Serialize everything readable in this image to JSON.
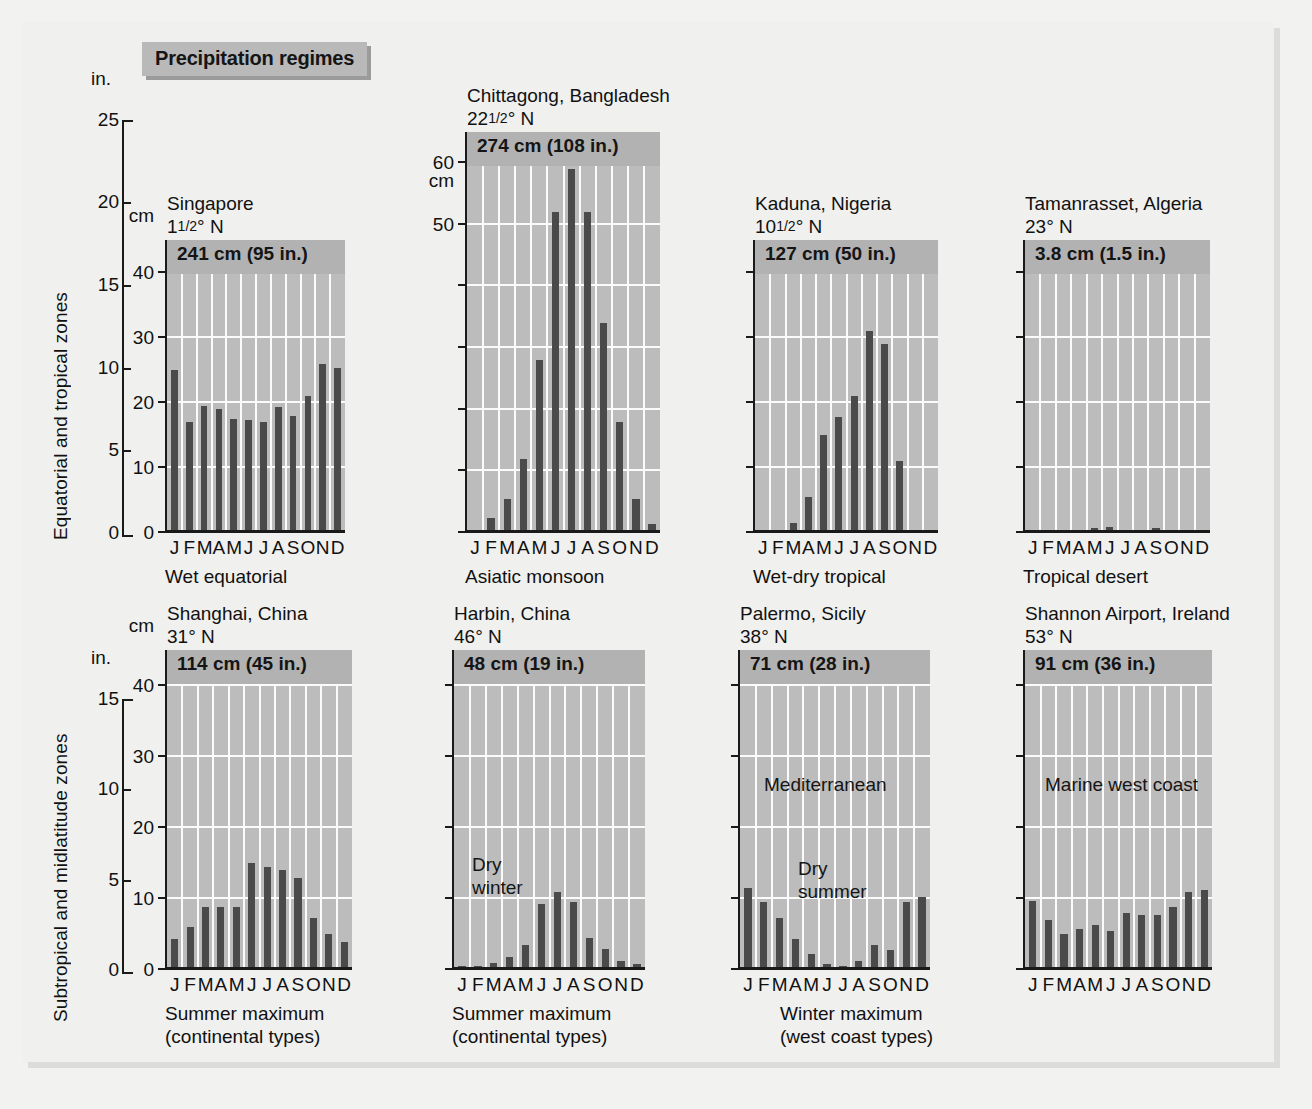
{
  "figure": {
    "title": "Precipitation regimes",
    "row_labels": {
      "top": "Equatorial and tropical zones",
      "bottom": "Subtropical and midlatitude zones"
    },
    "axis_units": {
      "inches": "in.",
      "cm": "cm"
    },
    "inch_ticks_top": [
      "25",
      "20",
      "15",
      "10",
      "5",
      "0"
    ],
    "inch_ticks_bottom": [
      "15",
      "10",
      "5",
      "0"
    ],
    "months_label": "J FMAMJ JASOND",
    "month_letters": [
      "J",
      "F",
      "M",
      "A",
      "M",
      "J",
      "J",
      "A",
      "S",
      "O",
      "N",
      "D"
    ],
    "colors": {
      "page_background": "#f2f2f0",
      "panel_plot": "#bcbcbc",
      "total_band": "#b2b2b2",
      "bar": "#4a4a4a",
      "grid": "#fbfbfb",
      "axis": "#1a1a1a",
      "badge": "#b9b9b9",
      "badge_shadow": "#9b9b9b"
    },
    "captions": [
      {
        "line1": "Summer maximum",
        "line2": "(continental types)"
      },
      {
        "line1": "Summer maximum",
        "line2": "(continental types)"
      },
      {
        "line1": "Winter maximum",
        "line2": "(west coast types)"
      }
    ]
  },
  "chart_data": {
    "type": "bar",
    "title": "Precipitation regimes",
    "xlabel": "",
    "ylabel": "Precipitation",
    "grid": true,
    "legend": "none",
    "panels": [
      {
        "id": "singapore",
        "station": "Singapore",
        "latitude": "1¹⁄₂° N",
        "annual_total": "241 cm (95 in.)",
        "annual_cm": 241,
        "annual_in": 95,
        "regime": "Wet equatorial",
        "cm_ticks": [
          0,
          10,
          20,
          30,
          40
        ],
        "cm_tick_labels": [
          "0",
          "10",
          "20",
          "30",
          "40"
        ],
        "ylim_cm": [
          0,
          45
        ],
        "categories": [
          "J",
          "F",
          "M",
          "A",
          "M",
          "J",
          "J",
          "A",
          "S",
          "O",
          "N",
          "D"
        ],
        "values_cm": [
          25.0,
          17.0,
          19.5,
          19.0,
          17.5,
          17.3,
          17.0,
          19.3,
          18.0,
          21.0,
          26.0,
          25.3
        ],
        "note": "",
        "row": "top"
      },
      {
        "id": "chittagong",
        "station": "Chittagong, Bangladesh",
        "latitude": "22¹⁄₂° N",
        "annual_total": "274 cm (108 in.)",
        "annual_cm": 274,
        "annual_in": 108,
        "regime": "Asiatic monsoon",
        "cm_ticks": [
          0,
          10,
          20,
          30,
          40,
          50,
          60
        ],
        "cm_tick_labels": [
          "",
          "",
          "",
          "",
          "",
          "50",
          "60"
        ],
        "ylim_cm": [
          0,
          65
        ],
        "categories": [
          "J",
          "F",
          "M",
          "A",
          "M",
          "J",
          "J",
          "A",
          "S",
          "O",
          "N",
          "D"
        ],
        "values_cm": [
          0.5,
          2.5,
          5.5,
          12.0,
          28.0,
          52.0,
          59.0,
          52.0,
          34.0,
          18.0,
          5.5,
          1.5
        ],
        "note": "",
        "row": "top"
      },
      {
        "id": "kaduna",
        "station": "Kaduna, Nigeria",
        "latitude": "10¹⁄₂° N",
        "annual_total": "127 cm (50 in.)",
        "annual_cm": 127,
        "annual_in": 50,
        "regime": "Wet-dry tropical",
        "cm_ticks": [
          0,
          10,
          20,
          30,
          40
        ],
        "cm_tick_labels": [
          "",
          "",
          "",
          "",
          ""
        ],
        "ylim_cm": [
          0,
          45
        ],
        "categories": [
          "J",
          "F",
          "M",
          "A",
          "M",
          "J",
          "J",
          "A",
          "S",
          "O",
          "N",
          "D"
        ],
        "values_cm": [
          0.5,
          0.4,
          1.5,
          5.5,
          15.0,
          17.8,
          21.0,
          31.0,
          29.0,
          11.0,
          0.5,
          0.5
        ],
        "note": "",
        "row": "top"
      },
      {
        "id": "tamanrasset",
        "station": "Tamanrasset, Algeria",
        "latitude": "23° N",
        "annual_total": "3.8 cm (1.5 in.)",
        "annual_cm": 3.8,
        "annual_in": 1.5,
        "regime": "Tropical desert",
        "cm_ticks": [
          0,
          10,
          20,
          30,
          40
        ],
        "cm_tick_labels": [
          "",
          "",
          "",
          "",
          ""
        ],
        "ylim_cm": [
          0,
          45
        ],
        "categories": [
          "J",
          "F",
          "M",
          "A",
          "M",
          "J",
          "J",
          "A",
          "S",
          "O",
          "N",
          "D"
        ],
        "values_cm": [
          0.5,
          0.4,
          0.5,
          0.3,
          0.8,
          0.9,
          0.2,
          0.3,
          0.7,
          0.4,
          0.5,
          0.2
        ],
        "note": "",
        "row": "top"
      },
      {
        "id": "shanghai",
        "station": "Shanghai, China",
        "latitude": "31° N",
        "annual_total": "114 cm (45 in.)",
        "annual_cm": 114,
        "annual_in": 45,
        "regime": "Summer maximum (continental types)",
        "cm_ticks": [
          0,
          10,
          20,
          30,
          40
        ],
        "cm_tick_labels": [
          "0",
          "10",
          "20",
          "30",
          "40"
        ],
        "ylim_cm": [
          0,
          45
        ],
        "categories": [
          "J",
          "F",
          "M",
          "A",
          "M",
          "J",
          "J",
          "A",
          "S",
          "O",
          "N",
          "D"
        ],
        "values_cm": [
          4.3,
          6.0,
          8.8,
          8.8,
          8.8,
          15.0,
          14.5,
          14.0,
          13.0,
          7.3,
          5.0,
          4.0
        ],
        "note": "",
        "row": "bottom"
      },
      {
        "id": "harbin",
        "station": "Harbin, China",
        "latitude": "46° N",
        "annual_total": "48 cm (19 in.)",
        "annual_cm": 48,
        "annual_in": 19,
        "regime": "Summer maximum (continental types)",
        "cm_ticks": [
          0,
          10,
          20,
          30,
          40
        ],
        "cm_tick_labels": [
          "",
          "",
          "",
          "",
          ""
        ],
        "ylim_cm": [
          0,
          45
        ],
        "categories": [
          "J",
          "F",
          "M",
          "A",
          "M",
          "J",
          "J",
          "A",
          "S",
          "O",
          "N",
          "D"
        ],
        "values_cm": [
          0.6,
          0.5,
          1.0,
          1.8,
          3.5,
          9.3,
          11.0,
          9.5,
          4.5,
          3.0,
          1.2,
          0.8
        ],
        "note": "Dry\nwinter",
        "note_line1": "Dry",
        "note_line2": "winter",
        "row": "bottom"
      },
      {
        "id": "palermo",
        "station": "Palermo, Sicily",
        "latitude": "38° N",
        "annual_total": "71 cm (28 in.)",
        "annual_cm": 71,
        "annual_in": 28,
        "regime": "Mediterranean",
        "cm_ticks": [
          0,
          10,
          20,
          30,
          40
        ],
        "cm_tick_labels": [
          "",
          "",
          "",
          "",
          ""
        ],
        "ylim_cm": [
          0,
          45
        ],
        "categories": [
          "J",
          "F",
          "M",
          "A",
          "M",
          "J",
          "J",
          "A",
          "S",
          "O",
          "N",
          "D"
        ],
        "values_cm": [
          11.5,
          9.5,
          7.3,
          4.3,
          2.3,
          0.8,
          0.5,
          1.3,
          3.5,
          2.8,
          9.5,
          10.3
        ],
        "note": "Mediterranean",
        "note2_line1": "Dry",
        "note2_line2": "summer",
        "row": "bottom"
      },
      {
        "id": "shannon",
        "station": "Shannon Airport, Ireland",
        "latitude": "53° N",
        "annual_total": "91 cm (36 in.)",
        "annual_cm": 91,
        "annual_in": 36,
        "regime": "Marine west coast",
        "cm_ticks": [
          0,
          10,
          20,
          30,
          40
        ],
        "cm_tick_labels": [
          "",
          "",
          "",
          "",
          ""
        ],
        "ylim_cm": [
          0,
          45
        ],
        "categories": [
          "J",
          "F",
          "M",
          "A",
          "M",
          "J",
          "J",
          "A",
          "S",
          "O",
          "N",
          "D"
        ],
        "values_cm": [
          9.7,
          7.0,
          5.0,
          5.8,
          6.3,
          5.5,
          8.0,
          7.8,
          7.8,
          8.8,
          11.0,
          11.3
        ],
        "note": "Marine west coast",
        "row": "bottom"
      }
    ]
  }
}
